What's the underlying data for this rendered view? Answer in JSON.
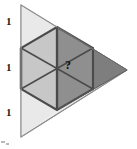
{
  "figure": {
    "type": "geometry-diagram",
    "canvas": {
      "width": 137,
      "height": 149
    },
    "colors": {
      "outer_fill": "#ededed",
      "outer_stroke": "#8d8d8d",
      "hexagon_fill": "#c9c9c9",
      "hexagon_stroke": "#4a4a4a",
      "shaded_fill": "#7d7d7d",
      "shaded_stroke": "#4a4a4a",
      "thin_stroke": "#6e6e6e",
      "label_color": "#1a1a1a",
      "background": "#ffffff"
    },
    "outer_triangle": {
      "name": "outer-triangle",
      "vertices": [
        {
          "name": "apex-top",
          "x": 21,
          "y": 5
        },
        {
          "name": "vertex-right",
          "x": 127,
          "y": 70
        },
        {
          "name": "apex-bottom",
          "x": 21,
          "y": 137
        }
      ]
    },
    "left_edge": {
      "name": "left-edge",
      "x": 21,
      "y_top": 5,
      "y_bottom": 137,
      "segments": 3
    },
    "hexagon": {
      "name": "inscribed-hexagon",
      "center": {
        "x": 57,
        "y": 68
      },
      "vertices": [
        {
          "x": 57,
          "y": 27
        },
        {
          "x": 93,
          "y": 48
        },
        {
          "x": 93,
          "y": 89
        },
        {
          "x": 57,
          "y": 110
        },
        {
          "x": 21,
          "y": 89
        },
        {
          "x": 21,
          "y": 48
        }
      ]
    },
    "shaded_region": {
      "name": "shaded-right-triangle",
      "vertices": [
        {
          "x": 57,
          "y": 27
        },
        {
          "x": 127,
          "y": 70
        },
        {
          "x": 57,
          "y": 110
        }
      ]
    },
    "labels": {
      "dimensions": [
        {
          "name": "dimension-label-top",
          "text": "1",
          "x": 8,
          "y": 18
        },
        {
          "name": "dimension-label-middle",
          "text": "1",
          "x": 8,
          "y": 64
        },
        {
          "name": "dimension-label-bottom",
          "text": "1",
          "x": 8,
          "y": 109
        }
      ],
      "unknown": {
        "name": "unknown-area-label",
        "text": "?",
        "x": 65,
        "y": 60
      }
    }
  }
}
